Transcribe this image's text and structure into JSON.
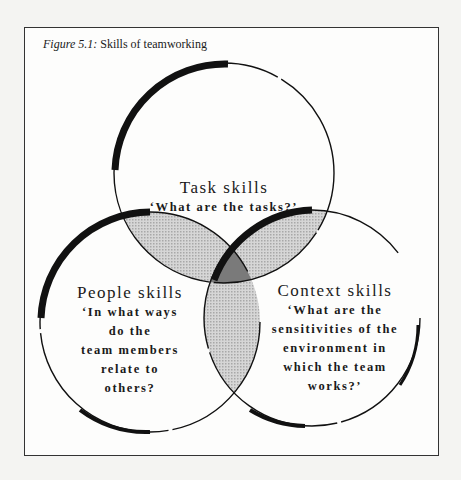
{
  "caption": {
    "prefix": "Figure 5.1:",
    "text": " Skills of teamworking"
  },
  "circles": [
    {
      "id": "task",
      "title": "Task skills",
      "lines": [
        "‘What are the tasks?’"
      ]
    },
    {
      "id": "people",
      "title": "People skills",
      "lines": [
        "‘In what ways",
        "do the",
        "team members",
        "relate to",
        "others?"
      ]
    },
    {
      "id": "context",
      "title": "Context skills",
      "lines": [
        "‘What are the",
        "sensitivities of the",
        "environment in",
        "which the team",
        "works?’"
      ]
    }
  ],
  "colors": {
    "frame": "#333333",
    "stroke": "#111111",
    "overlap": "#c8c8c8",
    "center": "#7a7a7a"
  }
}
